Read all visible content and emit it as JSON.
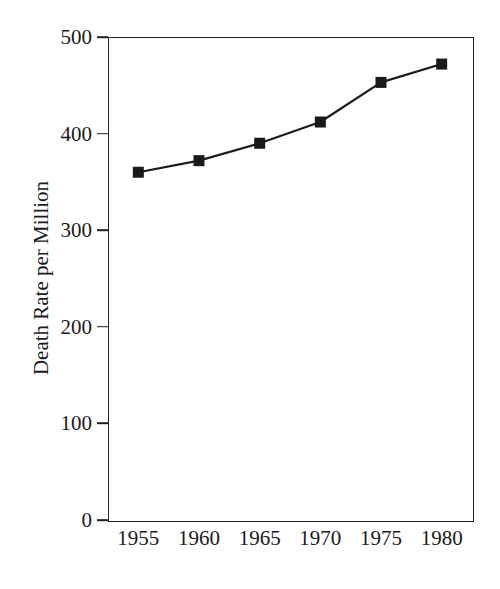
{
  "chart_data": {
    "type": "line",
    "title": "",
    "subtitle": "",
    "xlabel": "",
    "ylabel": "Death Rate per Million",
    "categories": [
      "1955",
      "1960",
      "1965",
      "1970",
      "1975",
      "1980"
    ],
    "x": [
      1955,
      1960,
      1965,
      1970,
      1975,
      1980
    ],
    "values": [
      360,
      372,
      390,
      412,
      453,
      472
    ],
    "series": [
      {
        "name": "Death Rate per Million",
        "values": [
          360,
          372,
          390,
          412,
          453,
          472
        ]
      }
    ],
    "xlim": [
      1952.5,
      1982.5
    ],
    "ylim": [
      0,
      500
    ],
    "yticks": [
      0,
      100,
      200,
      300,
      400,
      500
    ],
    "ytick_labels": [
      "0",
      "100",
      "200",
      "300",
      "400",
      "500"
    ],
    "xtick_labels": [
      "1955",
      "1960",
      "1965",
      "1970",
      "1975",
      "1980"
    ],
    "grid": false,
    "legend": false,
    "legend_position": "none",
    "marker": "filled-square",
    "line_color": "#1a1a1a",
    "marker_color": "#1a1a1a",
    "background_color": "#ffffff",
    "axis_color": "#1f1f1f",
    "annotations": []
  }
}
